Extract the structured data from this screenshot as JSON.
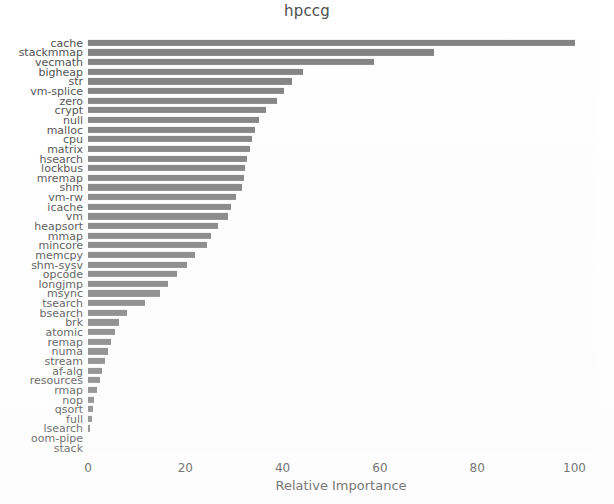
{
  "chart_data": {
    "type": "bar",
    "orientation": "horizontal",
    "title": "hpccg",
    "xlabel": "Relative Importance",
    "ylabel": "",
    "xlim": [
      0,
      104
    ],
    "xticks": [
      0,
      20,
      40,
      60,
      80,
      100
    ],
    "xtick_labels": [
      "0",
      "20",
      "40",
      "60",
      "80",
      "100"
    ],
    "grid": false,
    "legend": false,
    "bar_color": "#808080",
    "background_color": "#ffffff",
    "text_color": "#4d4d4d",
    "categories": [
      "cache",
      "stackmmap",
      "vecmath",
      "bigheap",
      "str",
      "vm-splice",
      "zero",
      "crypt",
      "null",
      "malloc",
      "cpu",
      "matrix",
      "hsearch",
      "lockbus",
      "mremap",
      "shm",
      "vm-rw",
      "icache",
      "vm",
      "heapsort",
      "mmap",
      "mincore",
      "memcpy",
      "shm-sysv",
      "opcode",
      "longjmp",
      "msync",
      "tsearch",
      "bsearch",
      "brk",
      "atomic",
      "remap",
      "numa",
      "stream",
      "af-alg",
      "resources",
      "rmap",
      "nop",
      "qsort",
      "full",
      "lsearch",
      "oom-pipe",
      "stack"
    ],
    "values": [
      100.0,
      71.2,
      58.7,
      44.2,
      41.9,
      40.3,
      38.8,
      36.5,
      35.2,
      34.4,
      33.8,
      33.3,
      32.7,
      32.3,
      32.0,
      31.6,
      30.4,
      29.4,
      28.8,
      26.8,
      25.2,
      24.5,
      22.0,
      20.3,
      18.2,
      16.5,
      14.9,
      11.8,
      8.0,
      6.4,
      5.5,
      4.7,
      4.1,
      3.4,
      2.8,
      2.4,
      1.8,
      1.2,
      1.0,
      0.8,
      0.5,
      0.0,
      0.0
    ]
  }
}
